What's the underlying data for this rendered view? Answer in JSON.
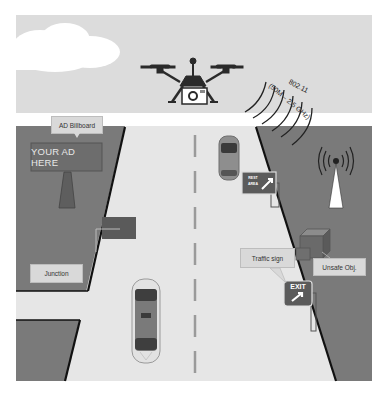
{
  "diagram": {
    "colors": {
      "sky": "#dcdcdc",
      "cloud": "#ffffff",
      "ground": "#7a7a7a",
      "road": "#e6e6e6",
      "road_edge": "#111111",
      "label_bg": "#d9d9d9",
      "sign_bg": "#5b5b5b",
      "drone": "#2a2a2a"
    },
    "labels": {
      "billboard_callout": "AD Billboard",
      "billboard_text": "YOUR AD HERE",
      "junction": "Junction",
      "traffic_sign": "Traffic sign",
      "unsafe_object": "Unsafe Obj.",
      "exit_sign": "EXIT",
      "rest_area_line1": "REST",
      "rest_area_line2": "AREA",
      "wifi_protocol": "802.11",
      "wifi_band": "(50M – 2.5 GHz)"
    },
    "icons": {
      "drone": "drone-with-camera-icon",
      "camera": "camera-icon",
      "cloud": "cloud-icon",
      "antenna": "radio-tower-icon",
      "car_top": "car-top-view-icon",
      "car_bottom": "car-top-view-icon",
      "box": "unsafe-object-box-icon",
      "arrow": "exit-arrow-icon"
    }
  }
}
